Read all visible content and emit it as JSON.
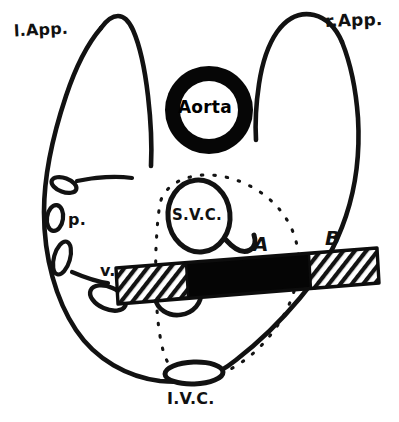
{
  "figure": {
    "canvas": {
      "width": 399,
      "height": 422
    },
    "colors": {
      "ink": "#111111",
      "background": "#ffffff",
      "band_fill": "#000000",
      "hatch": "#1a1a1a"
    }
  },
  "labels": {
    "left_appendage": "l.App.",
    "right_appendage": "r.App.",
    "aorta": "Aorta",
    "superior_vena_cava": "S.V.C.",
    "inferior_vena_cava": "I.V.C.",
    "marker_a": "A",
    "marker_b": "B",
    "pulmonary_artery": "p.",
    "vein": "v."
  },
  "structures": [
    {
      "name": "atrial-outline",
      "kind": "outline",
      "label": ""
    },
    {
      "name": "left-appendage-horn",
      "kind": "outline",
      "label": "l.App."
    },
    {
      "name": "right-appendage-horn",
      "kind": "outline",
      "label": "r.App."
    },
    {
      "name": "aorta-ring",
      "kind": "thick-ring",
      "label": "Aorta"
    },
    {
      "name": "svc-orifice",
      "kind": "oval",
      "label": "S.V.C."
    },
    {
      "name": "ivc-orifice",
      "kind": "oval",
      "label": "I.V.C."
    },
    {
      "name": "septum-dotted-ellipse",
      "kind": "dotted-ellipse",
      "label": ""
    },
    {
      "name": "resection-band",
      "kind": "band",
      "label": ""
    },
    {
      "name": "band-hatch-left",
      "kind": "hatched",
      "label": ""
    },
    {
      "name": "band-hatch-right",
      "kind": "hatched",
      "label": "B"
    },
    {
      "name": "pulmonary-ostia-chain",
      "kind": "ovals",
      "label": "p."
    },
    {
      "name": "vein-ostium",
      "kind": "oval",
      "label": "v."
    }
  ]
}
